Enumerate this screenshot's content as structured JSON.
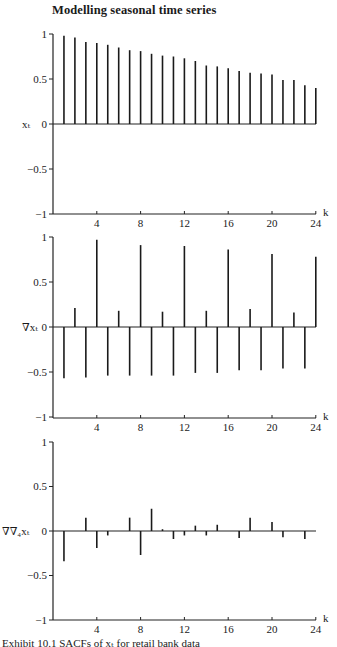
{
  "header": {
    "title": "Modelling seasonal time series"
  },
  "caption": "Exhibit 10.1 SACFs of xₜ for retail bank data",
  "chart_data": [
    {
      "type": "bar",
      "subtype": "stem",
      "title": "",
      "ylabel": "xₜ",
      "xlabel": "k",
      "ylim": [
        -1,
        1
      ],
      "yticks": [
        "1",
        "0.5",
        "0",
        "−0.5",
        "−1"
      ],
      "xticks": [
        "4",
        "8",
        "12",
        "16",
        "20",
        "24"
      ],
      "x": [
        1,
        2,
        3,
        4,
        5,
        6,
        7,
        8,
        9,
        10,
        11,
        12,
        13,
        14,
        15,
        16,
        17,
        18,
        19,
        20,
        21,
        22,
        23,
        24
      ],
      "values": [
        0.98,
        0.96,
        0.91,
        0.9,
        0.88,
        0.85,
        0.82,
        0.81,
        0.78,
        0.76,
        0.75,
        0.73,
        0.7,
        0.65,
        0.64,
        0.62,
        0.59,
        0.57,
        0.56,
        0.55,
        0.49,
        0.49,
        0.43,
        0.4
      ]
    },
    {
      "type": "bar",
      "subtype": "stem",
      "title": "",
      "ylabel": "∇xₜ",
      "xlabel": "k",
      "ylim": [
        -1,
        1
      ],
      "yticks": [
        "1",
        "0.5",
        "0",
        "−0.5",
        "−1"
      ],
      "xticks": [
        "4",
        "8",
        "12",
        "16",
        "20",
        "24"
      ],
      "x": [
        1,
        2,
        3,
        4,
        5,
        6,
        7,
        8,
        9,
        10,
        11,
        12,
        13,
        14,
        15,
        16,
        17,
        18,
        19,
        20,
        21,
        22,
        23,
        24
      ],
      "values": [
        -0.57,
        0.21,
        -0.56,
        0.97,
        -0.54,
        0.18,
        -0.54,
        0.91,
        -0.54,
        0.17,
        -0.54,
        0.9,
        -0.51,
        0.18,
        -0.51,
        0.86,
        -0.48,
        0.2,
        -0.48,
        0.81,
        -0.46,
        0.16,
        -0.46,
        0.78
      ]
    },
    {
      "type": "bar",
      "subtype": "stem",
      "title": "",
      "ylabel": "∇∇₄xₜ",
      "xlabel": "k",
      "ylim": [
        -1,
        1
      ],
      "yticks": [
        "1",
        "0.5",
        "0",
        "−0.5",
        "−1"
      ],
      "xticks": [
        "4",
        "8",
        "12",
        "16",
        "20",
        "24"
      ],
      "x": [
        1,
        2,
        3,
        4,
        5,
        6,
        7,
        8,
        9,
        10,
        11,
        12,
        13,
        14,
        15,
        16,
        17,
        18,
        19,
        20,
        21,
        22,
        23,
        24
      ],
      "values": [
        -0.34,
        0.0,
        0.15,
        -0.19,
        -0.05,
        0.0,
        0.15,
        -0.27,
        0.25,
        0.02,
        -0.09,
        -0.05,
        0.06,
        -0.05,
        0.07,
        0.0,
        -0.08,
        0.15,
        0.0,
        0.1,
        -0.07,
        0.0,
        -0.09,
        0.0
      ]
    }
  ],
  "panels": [
    {
      "top": 34,
      "zero": 124,
      "bottom": 214
    },
    {
      "top": 237,
      "zero": 327,
      "bottom": 418
    },
    {
      "top": 442,
      "zero": 531,
      "bottom": 620
    }
  ]
}
